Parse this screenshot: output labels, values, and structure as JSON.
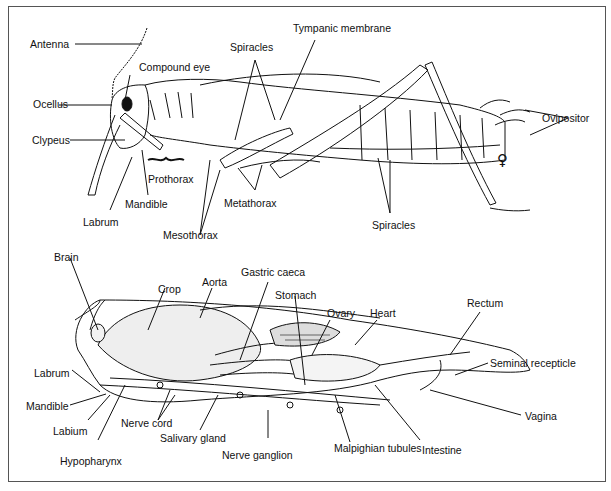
{
  "figure": {
    "colors": {
      "ink": "#111111",
      "border": "#555555",
      "background": "#ffffff",
      "shading": "#cfcfcf"
    },
    "external_anatomy": {
      "labels": {
        "antenna": "Antenna",
        "compound_eye": "Compound eye",
        "ocellus": "Ocellus",
        "clypeus": "Clypeus",
        "spiracles_upper": "Spiracles",
        "tympanic_membrane": "Tympanic membrane",
        "prothorax": "Prothorax",
        "mandible": "Mandible",
        "labrum": "Labrum",
        "metathorax": "Metathorax",
        "mesothorax": "Mesothorax",
        "spiracles_lower": "Spiracles",
        "ovipositor": "Ovipositor",
        "female_symbol": "♀"
      }
    },
    "internal_anatomy": {
      "labels": {
        "brain": "Brain",
        "crop": "Crop",
        "aorta": "Aorta",
        "gastric_caeca": "Gastric caeca",
        "stomach": "Stomach",
        "ovary": "Ovary",
        "heart": "Heart",
        "rectum": "Rectum",
        "seminal_recepticle": "Seminal recepticle",
        "labrum": "Labrum",
        "mandible": "Mandible",
        "labium": "Labium",
        "hypopharynx": "Hypopharynx",
        "nerve_cord": "Nerve cord",
        "salivary_gland": "Salivary gland",
        "nerve_ganglion": "Nerve ganglion",
        "malpighian_tubules": "Malpighian tubules",
        "intestine": "Intestine",
        "vagina": "Vagina"
      }
    }
  }
}
